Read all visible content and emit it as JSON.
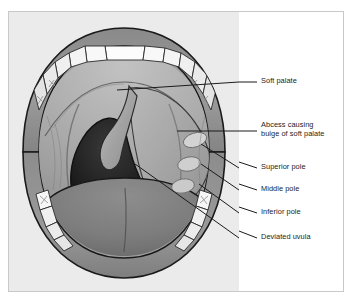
{
  "figure": {
    "border_color": "#c9c9c9",
    "illustration_background": "#ebebeb",
    "label_panel_background": "#ffffff"
  },
  "labels": [
    {
      "id": "soft-palate",
      "text": "Soft palate",
      "x": 22,
      "y": 66,
      "leader": {
        "x1": 18,
        "y1": 70,
        "x2": -122,
        "y2": 78
      }
    },
    {
      "id": "abcess-soft-palate",
      "text": "Abcess causing\nbulge of soft palate",
      "x": 22,
      "y": 111,
      "leader": {
        "x1": 18,
        "y1": 119,
        "x2": -62,
        "y2": 119
      }
    },
    {
      "id": "superior-pole",
      "text": "Superior pole",
      "x": 22,
      "y": 152,
      "leader": {
        "x1": 18,
        "y1": 156,
        "x2": -38,
        "y2": 132
      }
    },
    {
      "id": "middle-pole",
      "text": "Middle pole",
      "x": 22,
      "y": 174,
      "leader": {
        "x1": 18,
        "y1": 178,
        "x2": -38,
        "y2": 152
      }
    },
    {
      "id": "inferior-pole",
      "text": "Inferior pole",
      "x": 22,
      "y": 197,
      "leader": {
        "x1": 18,
        "y1": 201,
        "x2": -40,
        "y2": 172
      }
    },
    {
      "id": "deviated-uvula",
      "text": "Deviated uvula",
      "x": 22,
      "y": 222,
      "leader": {
        "x1": 18,
        "y1": 226,
        "x2": -104,
        "y2": 152
      }
    }
  ],
  "anatomy": {
    "structures": [
      "upper lip",
      "lower lip",
      "upper teeth",
      "lower teeth",
      "hard palate",
      "soft palate",
      "anterior tonsillar pillar",
      "posterior tonsillar pillar",
      "uvula",
      "oropharynx",
      "tongue",
      "peritonsillar abscess"
    ],
    "colors": {
      "lip": "#8f8f8f",
      "lip_shadow": "#767676",
      "outline": "#1a1a1a",
      "tooth": "#fbfbfb",
      "tooth_shadow": "#dcdcdc",
      "palate": "#a8a8a8",
      "palate_light": "#bdbdbd",
      "pharynx_dark": "#121212",
      "pharynx_mid": "#2e2e2e",
      "uvula": "#9a9a9a",
      "tongue": "#808080",
      "tongue_dark": "#6b6b6b",
      "pole": "#cfcfcf"
    }
  }
}
